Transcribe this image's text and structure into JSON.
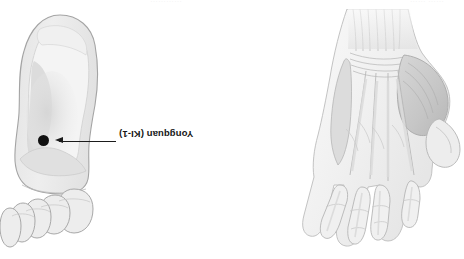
{
  "figure": {
    "orientation": "rotated-180",
    "background_color": "#ffffff",
    "ink_color": "#1b1b1b"
  },
  "crop_remnants": {
    "left": "…………",
    "right": "…… ……"
  },
  "panels": [
    {
      "id": "foot",
      "illustration_name": "foot-sole-illustration",
      "description": "plantar view of right foot",
      "fill_color": "#ebebeb",
      "outline_color": "#a8a8a8",
      "point": {
        "label": "Yongquan (KI-1)",
        "name": "Yongquan",
        "code": "KI-1",
        "dot_color": "#101010",
        "dot_size": "11",
        "leader": "arrow"
      }
    },
    {
      "id": "hand",
      "illustration_name": "hand-palm-anatomy-illustration",
      "description": "dissected palmar view of hand showing tendons and muscles",
      "fill_color": "#f3f3f3",
      "outline_color": "#9c9c9c",
      "point": {
        "label": "Laogong (PC-8)",
        "name": "Laogong",
        "code": "PC-8",
        "dot_color": "#101010",
        "dot_size": "4.5",
        "leader": "line"
      }
    }
  ]
}
